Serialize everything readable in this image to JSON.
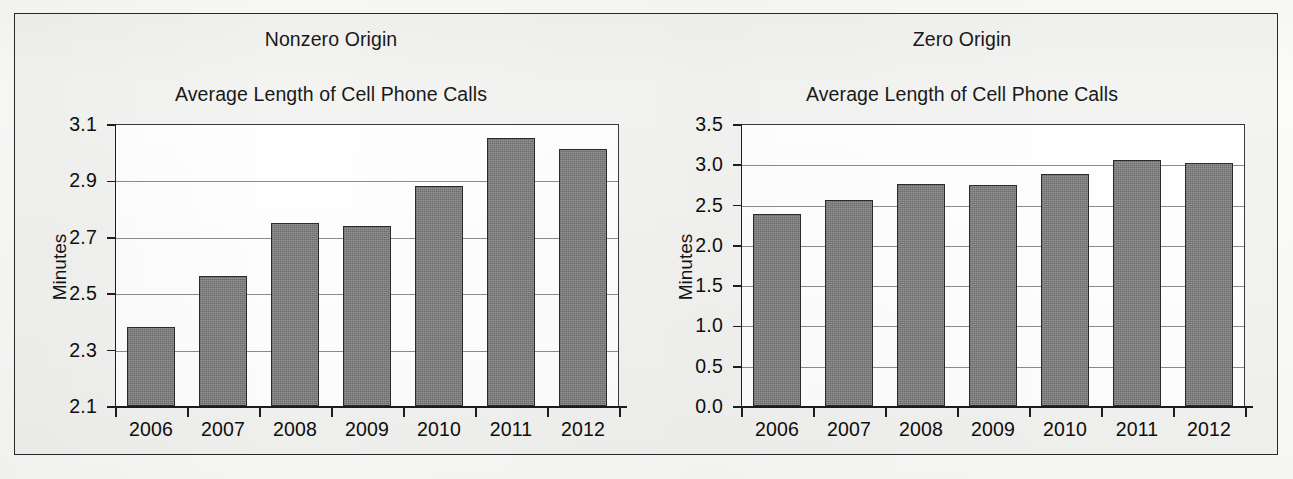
{
  "figure": {
    "background_color": "#f3f3f1",
    "bar_color": "#767676",
    "gridline_color": "#8d8d8d",
    "axis_color": "#1d1d1d"
  },
  "panels": [
    {
      "heading": "Nonzero Origin",
      "title": "Average Length of Cell Phone Calls",
      "ylabel": "Minutes"
    },
    {
      "heading": "Zero Origin",
      "title": "Average Length of Cell Phone Calls",
      "ylabel": "Minutes"
    }
  ],
  "chart_data": [
    {
      "type": "bar",
      "title": "Average Length of Cell Phone Calls",
      "subtitle": "Nonzero Origin",
      "xlabel": "",
      "ylabel": "Minutes",
      "categories": [
        "2006",
        "2007",
        "2008",
        "2009",
        "2010",
        "2011",
        "2012"
      ],
      "values": [
        2.38,
        2.56,
        2.75,
        2.74,
        2.88,
        3.05,
        3.01
      ],
      "ylim": [
        2.1,
        3.1
      ],
      "yticks": [
        "2.1",
        "2.3",
        "2.5",
        "2.7",
        "2.9",
        "3.1"
      ],
      "ytick_values": [
        2.1,
        2.3,
        2.5,
        2.7,
        2.9,
        3.1
      ],
      "grid": true,
      "legend": "none"
    },
    {
      "type": "bar",
      "title": "Average Length of Cell Phone Calls",
      "subtitle": "Zero Origin",
      "xlabel": "",
      "ylabel": "Minutes",
      "categories": [
        "2006",
        "2007",
        "2008",
        "2009",
        "2010",
        "2011",
        "2012"
      ],
      "values": [
        2.38,
        2.56,
        2.75,
        2.74,
        2.88,
        3.05,
        3.01
      ],
      "ylim": [
        0.0,
        3.5
      ],
      "yticks": [
        "0.0",
        "0.5",
        "1.0",
        "1.5",
        "2.0",
        "2.5",
        "3.0",
        "3.5"
      ],
      "ytick_values": [
        0.0,
        0.5,
        1.0,
        1.5,
        2.0,
        2.5,
        3.0,
        3.5
      ],
      "grid": true,
      "legend": "none"
    }
  ]
}
